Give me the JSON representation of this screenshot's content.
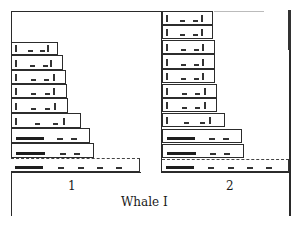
{
  "figure": {
    "title": "Whale I",
    "columns": [
      {
        "label": "1",
        "bars": [
          {
            "top": 42,
            "height": 13,
            "right": 58
          },
          {
            "top": 55,
            "height": 15,
            "right": 63
          },
          {
            "top": 70,
            "height": 14,
            "right": 66
          },
          {
            "top": 84,
            "height": 14,
            "right": 67
          },
          {
            "top": 98,
            "height": 15,
            "right": 68
          },
          {
            "top": 113,
            "height": 15,
            "right": 81
          },
          {
            "top": 128,
            "height": 15,
            "right": 90
          },
          {
            "top": 143,
            "height": 15,
            "right": 94
          },
          {
            "top": 158,
            "height": 14,
            "right": 140,
            "dashed": true
          }
        ]
      },
      {
        "label": "2",
        "bars": [
          {
            "top": 11,
            "height": 14,
            "right": 213
          },
          {
            "top": 25,
            "height": 14,
            "right": 213
          },
          {
            "top": 40,
            "height": 14,
            "right": 215
          },
          {
            "top": 54,
            "height": 15,
            "right": 215
          },
          {
            "top": 69,
            "height": 14,
            "right": 215
          },
          {
            "top": 84,
            "height": 14,
            "right": 217
          },
          {
            "top": 98,
            "height": 14,
            "right": 217
          },
          {
            "top": 113,
            "height": 14,
            "right": 225
          },
          {
            "top": 129,
            "height": 14,
            "right": 242
          },
          {
            "top": 144,
            "height": 14,
            "right": 244
          },
          {
            "top": 159,
            "height": 13,
            "right": 289,
            "dashed": true
          }
        ]
      }
    ]
  }
}
